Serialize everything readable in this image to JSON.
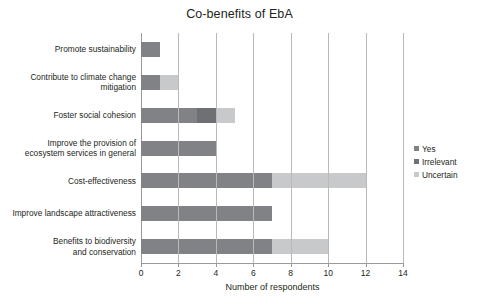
{
  "chart_data": {
    "type": "bar",
    "orientation": "horizontal",
    "stacked": true,
    "title": "Co-benefits of EbA",
    "xlabel": "Number of respondents",
    "ylabel": "",
    "xlim": [
      0,
      14
    ],
    "xticks": [
      0,
      2,
      4,
      6,
      8,
      10,
      12,
      14
    ],
    "grid": "vertical",
    "legend_position": "right",
    "categories": [
      "Promote sustainability",
      "Contribute to climate change mitigation",
      "Foster social cohesion",
      "Improve the provision of ecosystem services in general",
      "Cost-effectiveness",
      "Improve landscape attractiveness",
      "Benefits to biodiversity and conservation"
    ],
    "series": [
      {
        "name": "Yes",
        "color": "#808285",
        "values": [
          1,
          1,
          3,
          4,
          7,
          7,
          7
        ]
      },
      {
        "name": "Irrelevant",
        "color": "#6e7073",
        "values": [
          0,
          0,
          1,
          0,
          0,
          0,
          0
        ]
      },
      {
        "name": "Uncertain",
        "color": "#c8c9cb",
        "values": [
          0,
          1,
          1,
          0,
          5,
          0,
          3
        ]
      }
    ]
  },
  "axis": {
    "tick_labels": [
      "0",
      "2",
      "4",
      "6",
      "8",
      "10",
      "12",
      "14"
    ],
    "x_title": "Number of respondents"
  },
  "category_labels": [
    {
      "line1": "Promote sustainability",
      "line2": ""
    },
    {
      "line1": "Contribute to climate change",
      "line2": "mitigation"
    },
    {
      "line1": "Foster social cohesion",
      "line2": ""
    },
    {
      "line1": "Improve the provision of",
      "line2": "ecosystem services in general"
    },
    {
      "line1": "Cost-effectiveness",
      "line2": ""
    },
    {
      "line1": "Improve landscape attractiveness",
      "line2": ""
    },
    {
      "line1": "Benefits to biodiversity",
      "line2": "and conservation"
    }
  ],
  "legend": {
    "items": [
      {
        "label": "Yes",
        "color": "#808285"
      },
      {
        "label": "Irrelevant",
        "color": "#6e7073"
      },
      {
        "label": "Uncertain",
        "color": "#c8c9cb"
      }
    ]
  },
  "title": "Co-benefits of EbA"
}
